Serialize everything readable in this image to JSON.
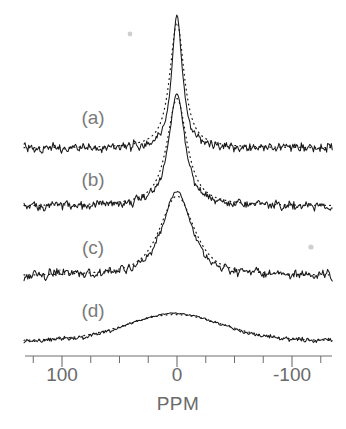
{
  "figure": {
    "name": "nmr-spectra-stack",
    "background_color": "#ffffff",
    "ink_color": "#1a1a1a",
    "label_color": "#6a6a6a"
  },
  "axis": {
    "title": "PPM",
    "tick_labels": [
      "100",
      "0",
      "-100"
    ],
    "major_ticks": [
      100,
      0,
      -100
    ],
    "minor_tick_step": 25,
    "minor_ticks": [
      125,
      75,
      50,
      25,
      -25,
      -50,
      -75,
      -125
    ],
    "range": [
      133,
      -135
    ],
    "direction": "decreasing-left-to-right"
  },
  "panels": [
    {
      "label": "(a)",
      "linewidth_ppm": 11,
      "relative_height": 1.0
    },
    {
      "label": "(b)",
      "linewidth_ppm": 17,
      "relative_height": 0.92
    },
    {
      "label": "(c)",
      "linewidth_ppm": 30,
      "relative_height": 0.78
    },
    {
      "label": "(d)",
      "linewidth_ppm": 95,
      "relative_height": 0.42
    }
  ],
  "chart_data": {
    "type": "line",
    "title": "",
    "xlabel": "PPM",
    "ylabel": "",
    "xlim": [
      133,
      -135
    ],
    "grid": false,
    "legend": null,
    "stacked_panels": true,
    "x_tick_values": [
      100,
      0,
      -100
    ],
    "x_tick_labels": [
      "100",
      "0",
      "-100"
    ],
    "series": [
      {
        "name": "(a) experimental",
        "style": "solid",
        "panel": "(a)",
        "peak_center_ppm": 0,
        "fwhm_ppm": 11,
        "peak_amplitude": 1.0,
        "baseline_noise": 0.035
      },
      {
        "name": "(a) simulated",
        "style": "dotted",
        "panel": "(a)",
        "peak_center_ppm": 0,
        "fwhm_ppm": 15,
        "peak_amplitude": 0.95,
        "baseline_noise": 0.0
      },
      {
        "name": "(b) experimental",
        "style": "solid",
        "panel": "(b)",
        "peak_center_ppm": 0,
        "fwhm_ppm": 17,
        "peak_amplitude": 0.92,
        "baseline_noise": 0.035
      },
      {
        "name": "(b) simulated",
        "style": "dotted",
        "panel": "(b)",
        "peak_center_ppm": 0,
        "fwhm_ppm": 21,
        "peak_amplitude": 0.88,
        "baseline_noise": 0.0
      },
      {
        "name": "(c) experimental",
        "style": "solid",
        "panel": "(c)",
        "peak_center_ppm": 0,
        "fwhm_ppm": 30,
        "peak_amplitude": 0.78,
        "baseline_noise": 0.04
      },
      {
        "name": "(c) simulated",
        "style": "dotted",
        "panel": "(c)",
        "peak_center_ppm": 0,
        "fwhm_ppm": 36,
        "peak_amplitude": 0.74,
        "baseline_noise": 0.0
      },
      {
        "name": "(d) experimental",
        "style": "solid",
        "panel": "(d)",
        "peak_center_ppm": 2,
        "fwhm_ppm": 95,
        "peak_amplitude": 0.42,
        "baseline_noise": 0.035
      },
      {
        "name": "(d) simulated",
        "style": "dotted",
        "panel": "(d)",
        "peak_center_ppm": 2,
        "fwhm_ppm": 102,
        "peak_amplitude": 0.4,
        "baseline_noise": 0.0
      }
    ]
  }
}
